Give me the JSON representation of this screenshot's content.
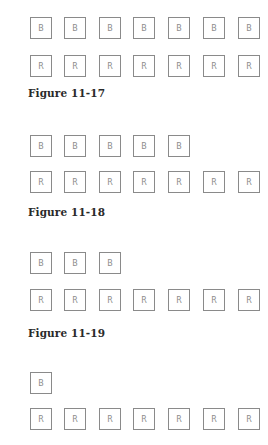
{
  "figures": [
    {
      "caption": "Figure 11-17",
      "b_row": [
        "B",
        "B",
        "B",
        "B",
        "B",
        "B",
        "B"
      ],
      "r_row": [
        "R",
        "R",
        "R",
        "R",
        "R",
        "R",
        "R"
      ]
    },
    {
      "caption": "Figure 11-18",
      "b_row": [
        "B",
        "B",
        "B",
        "B",
        "B"
      ],
      "r_row": [
        "R",
        "R",
        "R",
        "R",
        "R",
        "R",
        "R"
      ]
    },
    {
      "caption": "Figure 11-19",
      "b_row": [
        "B",
        "B",
        "B"
      ],
      "r_row": [
        "R",
        "R",
        "R",
        "R",
        "R",
        "R",
        "R"
      ]
    },
    {
      "caption": "",
      "b_row": [
        "B"
      ],
      "r_row": [
        "R",
        "R",
        "R",
        "R",
        "R",
        "R",
        "R"
      ]
    }
  ],
  "layout": {
    "box_x": [
      30,
      64,
      99,
      133,
      168,
      203,
      238
    ],
    "figure_y": [
      {
        "b": 17,
        "r": 55,
        "caption": 87
      },
      {
        "b": 135,
        "r": 171,
        "caption": 206
      },
      {
        "b": 252,
        "r": 289,
        "caption": 327
      },
      {
        "b": 372,
        "r": 408,
        "caption": null
      }
    ]
  }
}
